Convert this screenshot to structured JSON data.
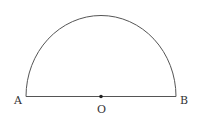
{
  "diagram": {
    "type": "semicircle",
    "labels": {
      "left_endpoint": "A",
      "right_endpoint": "B",
      "center": "O"
    },
    "colors": {
      "stroke": "#555555",
      "center_point": "#222222",
      "text": "#333333"
    }
  }
}
